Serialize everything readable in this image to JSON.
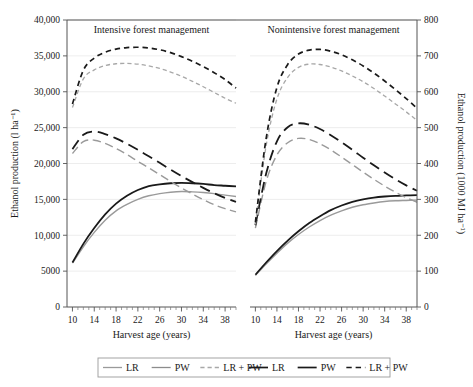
{
  "chart_data": {
    "type": "line",
    "title": "",
    "xlabel": "Harvest age (years)",
    "ylabel": "Ethanol production (l ha⁻¹)",
    "ylabel_right": "Ethanol production (1000 MJ ha⁻¹)",
    "xlim": [
      9,
      40
    ],
    "ylim": [
      0,
      40000
    ],
    "ylim_right": [
      0,
      800
    ],
    "grid": true,
    "legend_position": "bottom",
    "xticks": [
      10,
      14,
      18,
      22,
      26,
      30,
      34,
      38
    ],
    "xticklabels": [
      "10",
      "14",
      "18",
      "22",
      "26",
      "30",
      "34",
      "38"
    ],
    "yticks": [
      0,
      5000,
      10000,
      15000,
      20000,
      25000,
      30000,
      35000,
      40000
    ],
    "yticklabels": [
      "0",
      "5000",
      "10,000",
      "15,000",
      "20,000",
      "25,000",
      "30,000",
      "35,000",
      "40,000"
    ],
    "yticks_right": [
      0,
      100,
      200,
      300,
      400,
      500,
      600,
      700,
      800
    ],
    "yticklabels_right": [
      "0",
      "100",
      "200",
      "300",
      "400",
      "500",
      "600",
      "700",
      "800"
    ],
    "panels": [
      {
        "title": "Intensive forest management",
        "x": [
          10,
          12,
          14,
          16,
          18,
          20,
          22,
          24,
          26,
          28,
          30,
          32,
          34,
          36,
          38,
          40
        ],
        "series": [
          {
            "name": "LR",
            "style": "solid",
            "color": "#9a9a9a",
            "width": 1.4,
            "values": [
              6100,
              8400,
              10400,
              12100,
              13400,
              14300,
              15000,
              15500,
              15800,
              16000,
              16100,
              16050,
              15950,
              15800,
              15600,
              15400
            ]
          },
          {
            "name": "PW",
            "style": "solid",
            "color": "#1a1a1a",
            "width": 1.8,
            "values": [
              6200,
              8800,
              11000,
              12900,
              14400,
              15500,
              16300,
              16850,
              17100,
              17250,
              17300,
              17250,
              17150,
              17000,
              16900,
              16800
            ]
          },
          {
            "name": "LR + PW",
            "style": "longdash",
            "color": "#9a9a9a",
            "width": 1.4,
            "values": [
              21400,
              23050,
              23250,
              22800,
              22100,
              21250,
              20300,
              19400,
              18450,
              17500,
              16600,
              15750,
              14950,
              14250,
              13700,
              13250
            ]
          },
          {
            "name": "PW-dash",
            "style": "longdash",
            "color": "#1a1a1a",
            "width": 1.8,
            "values": [
              22000,
              24000,
              24450,
              24100,
              23500,
              22750,
              21900,
              21000,
              20100,
              19150,
              18250,
              17400,
              16600,
              15850,
              15200,
              14650
            ]
          },
          {
            "name": "LR + PW gray",
            "style": "dash",
            "color": "#a8a8a8",
            "width": 1.3,
            "values": [
              27800,
              31800,
              33050,
              33650,
              33900,
              33950,
              33850,
              33600,
              33250,
              32750,
              32150,
              31450,
              30700,
              29900,
              29100,
              28400
            ]
          },
          {
            "name": "LR + PW black",
            "style": "dash",
            "color": "#1a1a1a",
            "width": 1.7,
            "values": [
              28300,
              33000,
              34700,
              35500,
              35950,
              36150,
              36200,
              36100,
              35850,
              35450,
              34900,
              34250,
              33500,
              32650,
              31700,
              30500
            ]
          }
        ]
      },
      {
        "title": "Nonintensive forest management",
        "x": [
          10,
          12,
          14,
          16,
          18,
          20,
          22,
          24,
          26,
          28,
          30,
          32,
          34,
          36,
          38,
          40
        ],
        "series": [
          {
            "name": "LR",
            "style": "solid",
            "color": "#9a9a9a",
            "width": 1.4,
            "values": [
              4400,
              6000,
              7500,
              8900,
              10100,
              11150,
              12050,
              12800,
              13400,
              13900,
              14250,
              14500,
              14700,
              14800,
              14850,
              14900
            ]
          },
          {
            "name": "PW",
            "style": "solid",
            "color": "#1a1a1a",
            "width": 1.8,
            "values": [
              4500,
              6200,
              7800,
              9250,
              10550,
              11700,
              12650,
              13500,
              14150,
              14650,
              15000,
              15250,
              15400,
              15500,
              15550,
              15600
            ]
          },
          {
            "name": "LR + PW",
            "style": "longdash",
            "color": "#9a9a9a",
            "width": 1.4,
            "values": [
              11000,
              17500,
              21200,
              22900,
              23500,
              23350,
              22750,
              21900,
              20900,
              19850,
              18800,
              17800,
              16850,
              16000,
              15250,
              14600
            ]
          },
          {
            "name": "PW-dash",
            "style": "longdash",
            "color": "#1a1a1a",
            "width": 1.8,
            "values": [
              11400,
              18600,
              23100,
              25050,
              25600,
              25400,
              24800,
              23950,
              22950,
              21900,
              20800,
              19750,
              18750,
              17800,
              16950,
              16200
            ]
          },
          {
            "name": "LR + PW gray",
            "style": "dash",
            "color": "#a8a8a8",
            "width": 1.3,
            "values": [
              11500,
              22500,
              29000,
              32000,
              33400,
              33850,
              33800,
              33450,
              32900,
              32200,
              31400,
              30450,
              29400,
              28300,
              27200,
              26000
            ]
          },
          {
            "name": "LR + PW black",
            "style": "dash",
            "color": "#1a1a1a",
            "width": 1.7,
            "values": [
              11800,
              23500,
              30600,
              33800,
              35250,
              35800,
              35900,
              35650,
              35150,
              34450,
              33600,
              32600,
              31500,
              30300,
              29050,
              27700
            ]
          }
        ]
      }
    ],
    "legend": [
      {
        "label": "LR",
        "style": "solid",
        "color": "#9a9a9a"
      },
      {
        "label": "PW",
        "style": "solid",
        "color": "#8c8c8c"
      },
      {
        "label": "LR + PW",
        "style": "dash",
        "color": "#a8a8a8"
      },
      {
        "label": "LR",
        "style": "solid",
        "color": "#1a1a1a"
      },
      {
        "label": "PW",
        "style": "solid",
        "color": "#1a1a1a"
      },
      {
        "label": "LR + PW",
        "style": "dash",
        "color": "#1a1a1a"
      }
    ]
  }
}
